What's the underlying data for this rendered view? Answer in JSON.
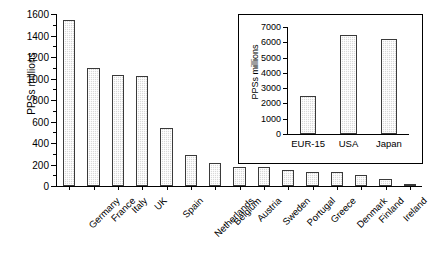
{
  "chart_data": [
    {
      "id": "main",
      "type": "bar",
      "title": "",
      "xlabel": "",
      "ylabel": "PPSs millions",
      "ylim": [
        0,
        1600
      ],
      "ytick_step": 200,
      "yminor_step": 100,
      "grid": false,
      "legend": "none",
      "categories": [
        "Germany",
        "France",
        "Italy",
        "UK",
        "Spain",
        "Netherlands",
        "Belgium",
        "Austria",
        "Sweden",
        "Portugal",
        "Greece",
        "Denmark",
        "Finland",
        "Ireland",
        "Luxemburg"
      ],
      "values": [
        1540,
        1100,
        1030,
        1020,
        540,
        285,
        210,
        180,
        175,
        150,
        135,
        130,
        105,
        65,
        10
      ],
      "ytick_labels": [
        "0",
        "200",
        "400",
        "600",
        "800",
        "1000",
        "1200",
        "1400",
        "1600"
      ],
      "bar_fill": "#d9d9d9",
      "bar_edge": "#3a3a3a"
    },
    {
      "id": "inset",
      "type": "bar",
      "title": "",
      "xlabel": "",
      "ylabel": "PPSs millions",
      "ylim": [
        0,
        7000
      ],
      "ytick_step": 1000,
      "grid": false,
      "legend": "none",
      "categories": [
        "EUR-15",
        "USA",
        "Japan"
      ],
      "values": [
        2500,
        6450,
        6220
      ],
      "ytick_labels": [
        "0",
        "1000",
        "2000",
        "3000",
        "4000",
        "5000",
        "6000",
        "7000"
      ],
      "bar_fill": "#d9d9d9",
      "bar_edge": "#3a3a3a"
    }
  ]
}
